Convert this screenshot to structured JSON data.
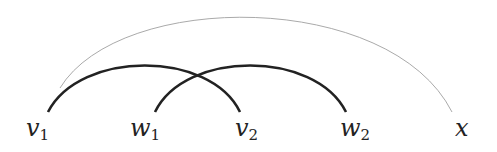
{
  "diagram": {
    "type": "arc-diagram",
    "nodes": [
      {
        "id": "v1",
        "base": "v",
        "sub": "1",
        "x": 48
      },
      {
        "id": "w1",
        "base": "w",
        "sub": "1",
        "x": 155
      },
      {
        "id": "v2",
        "base": "v",
        "sub": "2",
        "x": 240
      },
      {
        "id": "w2",
        "base": "w",
        "sub": "2",
        "x": 346
      },
      {
        "id": "x",
        "base": "x",
        "sub": "",
        "x": 452
      }
    ],
    "edges": [
      {
        "from": "v1",
        "to": "v2",
        "style": "thick",
        "color": "#222222"
      },
      {
        "from": "w1",
        "to": "w2",
        "style": "thick",
        "color": "#222222"
      },
      {
        "from": "v1",
        "to": "x",
        "style": "thin",
        "color": "#aaaaaa"
      }
    ]
  }
}
